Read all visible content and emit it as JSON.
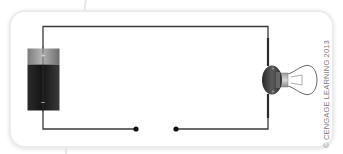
{
  "diagram": {
    "components": [
      {
        "id": "battery",
        "label": "Battery (D cell)",
        "terminals": [
          "+",
          "−"
        ]
      },
      {
        "id": "switch",
        "label": "Open switch (gap between two contact points)"
      },
      {
        "id": "bulb",
        "label": "Light bulb in socket"
      }
    ],
    "battery": {
      "positive_symbol": "+",
      "negative_symbol": "−"
    },
    "colors": {
      "wire": "#3a3a3a",
      "battery_cap": "#9a9a9a",
      "battery_body": "#1e1e1e",
      "socket": "#3c3c3c",
      "card_border": "#e4e4e4"
    }
  },
  "credit": "© CENGAGE LEARNING 2013"
}
